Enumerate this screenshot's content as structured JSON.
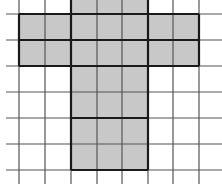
{
  "diagram": {
    "type": "grid-shape",
    "colors": {
      "background": "#ffffff",
      "fill": "#c8c8c8",
      "grid_line": "#555555",
      "outline": "#1a1a1a"
    },
    "grid": {
      "vertical_lines_x": [
        19,
        45,
        71,
        97,
        122,
        148,
        173,
        199
      ],
      "horizontal_lines_y": [
        14,
        40,
        66,
        92,
        118,
        144,
        170
      ],
      "vertical_extent": [
        0,
        184
      ],
      "horizontal_extent": [
        6,
        222
      ]
    },
    "shaded_regions": [
      {
        "name": "top-arm",
        "x": 71,
        "y": 0,
        "w": 77,
        "h": 14
      },
      {
        "name": "crossbar",
        "x": 19,
        "y": 14,
        "w": 180,
        "h": 52
      },
      {
        "name": "stem",
        "x": 71,
        "y": 66,
        "w": 77,
        "h": 104
      }
    ],
    "thick_segments": [
      [
        19,
        14,
        199,
        14
      ],
      [
        19,
        40,
        199,
        40
      ],
      [
        19,
        66,
        199,
        66
      ],
      [
        19,
        14,
        19,
        66
      ],
      [
        199,
        14,
        199,
        66
      ],
      [
        71,
        0,
        71,
        170
      ],
      [
        148,
        0,
        148,
        170
      ],
      [
        71,
        118,
        148,
        118
      ],
      [
        71,
        170,
        148,
        170
      ]
    ]
  }
}
